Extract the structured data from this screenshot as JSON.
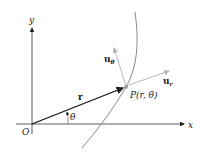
{
  "diagram": {
    "type": "polar-coordinates-unit-vectors",
    "axes": {
      "x_label": "x",
      "y_label": "y",
      "origin_label": "O"
    },
    "vector_r": {
      "label": "r"
    },
    "angle": {
      "label": "θ"
    },
    "point": {
      "label": "P(r, θ)"
    },
    "unit_vectors": {
      "u_r": {
        "base": "u",
        "sub": "r"
      },
      "u_theta": {
        "base": "u",
        "sub": "θ"
      }
    },
    "colors": {
      "axis": "#333333",
      "vector_r": "#111111",
      "curve": "#8a8a8a",
      "unit_vectors": "#b8b8b8",
      "point": "#9a9a9a"
    }
  }
}
